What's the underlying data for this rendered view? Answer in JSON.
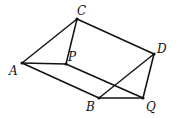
{
  "points": {
    "A": {
      "label": "A",
      "x": 22,
      "y": 63,
      "lx": 9,
      "ly": 75
    },
    "C": {
      "label": "C",
      "x": 77,
      "y": 19,
      "lx": 77,
      "ly": 15
    },
    "P": {
      "label": "P",
      "x": 66,
      "y": 64,
      "lx": 68,
      "ly": 61
    },
    "D": {
      "label": "D",
      "x": 154,
      "y": 54,
      "lx": 157,
      "ly": 53
    },
    "B": {
      "label": "B",
      "x": 99,
      "y": 98,
      "lx": 86,
      "ly": 111
    },
    "Q": {
      "label": "Q",
      "x": 143,
      "y": 98,
      "lx": 146,
      "ly": 111
    }
  },
  "edges": [
    [
      "A",
      "C"
    ],
    [
      "C",
      "P"
    ],
    [
      "A",
      "P"
    ],
    [
      "A",
      "B"
    ],
    [
      "C",
      "D"
    ],
    [
      "P",
      "Q"
    ],
    [
      "D",
      "B"
    ],
    [
      "D",
      "Q"
    ],
    [
      "B",
      "Q"
    ]
  ]
}
